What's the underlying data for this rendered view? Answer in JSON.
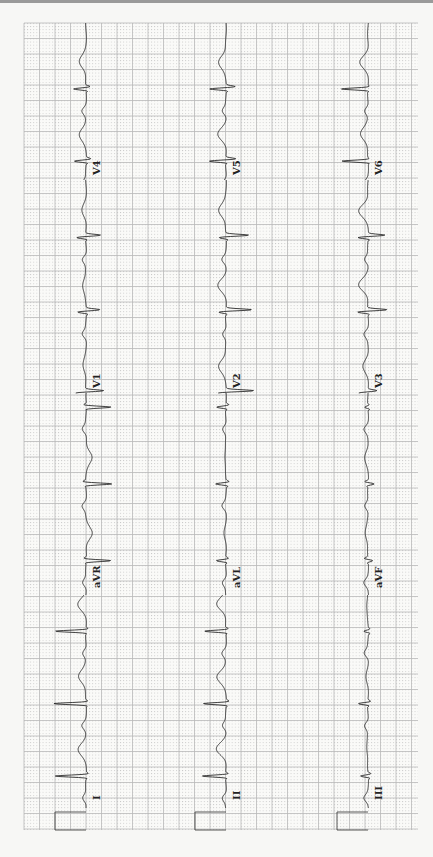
{
  "chart_data": {
    "type": "line",
    "orientation": "rotated-clockwise",
    "paper": {
      "grid": true,
      "major_mm": 5,
      "minor_mm": 1,
      "grid_color": "#b9b9b9",
      "dot_color": "#c8c8c8",
      "trace_color": "#2a2a2a",
      "background": "#fafaf8"
    },
    "calibration": {
      "mV": 1,
      "mm": 10
    },
    "columns": [
      {
        "leads": [
          {
            "label": "I",
            "beats": [
              {
                "t": 0.15,
                "r": 1.0,
                "s": -0.08,
                "tw": 0.25
              },
              {
                "t": 0.49,
                "r": 1.05,
                "s": -0.08,
                "tw": 0.25
              },
              {
                "t": 0.83,
                "r": 1.0,
                "s": -0.08,
                "tw": 0.25
              }
            ]
          },
          {
            "label": "aVR",
            "beats": [
              {
                "t": 0.17,
                "r": -0.8,
                "s": 0.1,
                "tw": -0.2
              },
              {
                "t": 0.55,
                "r": -0.85,
                "s": 0.1,
                "tw": -0.2
              },
              {
                "t": 0.93,
                "r": -0.8,
                "s": 0.1,
                "tw": -0.2
              }
            ]
          },
          {
            "label": "V1",
            "beats": [
              {
                "t": 0.0,
                "r": 0.35,
                "s": -0.6,
                "tw": 0.1
              },
              {
                "t": 0.38,
                "r": 0.3,
                "s": -0.45,
                "tw": 0.12
              },
              {
                "t": 0.73,
                "r": 0.3,
                "s": -0.5,
                "tw": 0.12
              }
            ]
          },
          {
            "label": "V4",
            "beats": [
              {
                "t": 0.12,
                "r": 0.4,
                "s": -0.15,
                "tw": 0.22
              },
              {
                "t": 0.58,
                "r": 0.4,
                "s": -0.15,
                "tw": 0.22
              }
            ]
          }
        ]
      },
      {
        "leads": [
          {
            "label": "II",
            "beats": [
              {
                "t": 0.15,
                "r": 0.75,
                "s": -0.1,
                "tw": 0.3
              },
              {
                "t": 0.49,
                "r": 0.75,
                "s": -0.1,
                "tw": 0.3
              },
              {
                "t": 0.83,
                "r": 0.7,
                "s": -0.1,
                "tw": 0.3
              }
            ]
          },
          {
            "label": "aVL",
            "beats": [
              {
                "t": 0.17,
                "r": 0.3,
                "s": -0.1,
                "tw": 0.05
              },
              {
                "t": 0.55,
                "r": 0.35,
                "s": -0.1,
                "tw": 0.05
              },
              {
                "t": 0.93,
                "r": 0.3,
                "s": -0.1,
                "tw": 0.05
              }
            ]
          },
          {
            "label": "V2",
            "beats": [
              {
                "t": 0.0,
                "r": 0.3,
                "s": -0.9,
                "tw": 0.25
              },
              {
                "t": 0.38,
                "r": 0.25,
                "s": -0.85,
                "tw": 0.25
              },
              {
                "t": 0.73,
                "r": 0.25,
                "s": -0.75,
                "tw": 0.25
              }
            ]
          },
          {
            "label": "V5",
            "beats": [
              {
                "t": 0.12,
                "r": 0.55,
                "s": -0.35,
                "tw": 0.25
              },
              {
                "t": 0.58,
                "r": 0.55,
                "s": -0.3,
                "tw": 0.25
              }
            ]
          }
        ]
      },
      {
        "leads": [
          {
            "label": "III",
            "beats": [
              {
                "t": 0.15,
                "r": 0.25,
                "s": -0.1,
                "tw": 0.05
              },
              {
                "t": 0.49,
                "r": 0.3,
                "s": -0.1,
                "tw": 0.05
              },
              {
                "t": 0.83,
                "r": 0.15,
                "s": -0.05,
                "tw": 0.05
              }
            ]
          },
          {
            "label": "aVF",
            "beats": [
              {
                "t": 0.17,
                "r": -0.15,
                "s": 0.12,
                "tw": 0.1
              },
              {
                "t": 0.55,
                "r": -0.2,
                "s": 0.12,
                "tw": 0.1
              },
              {
                "t": 0.93,
                "r": 0.1,
                "s": -0.05,
                "tw": 0.05
              }
            ]
          },
          {
            "label": "V3",
            "beats": [
              {
                "t": 0.0,
                "r": 0.3,
                "s": -0.3,
                "tw": 0.15
              },
              {
                "t": 0.38,
                "r": 0.35,
                "s": -0.65,
                "tw": 0.3
              },
              {
                "t": 0.73,
                "r": 0.35,
                "s": -0.55,
                "tw": 0.3
              }
            ]
          },
          {
            "label": "V6",
            "beats": [
              {
                "t": 0.12,
                "r": 0.85,
                "s": -0.05,
                "tw": 0.25
              },
              {
                "t": 0.58,
                "r": 0.85,
                "s": -0.05,
                "tw": 0.25
              }
            ]
          }
        ]
      }
    ],
    "units": {
      "amplitude": "mV",
      "time": "fraction of lead segment"
    }
  }
}
